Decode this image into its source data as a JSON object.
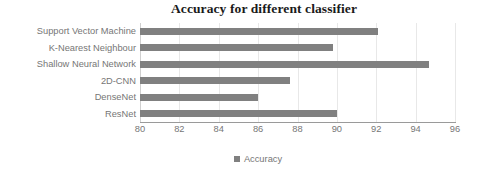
{
  "chart_data": {
    "type": "bar",
    "orientation": "horizontal",
    "title": "Accuracy for different classifier",
    "xlabel": "",
    "ylabel": "",
    "xlim": [
      80,
      96
    ],
    "xticks": [
      80,
      82,
      84,
      86,
      88,
      90,
      92,
      94,
      96
    ],
    "xtick_labels": [
      "80",
      "82",
      "84",
      "86",
      "88",
      "90",
      "92",
      "94",
      "96"
    ],
    "grid": "vertical",
    "legend": {
      "position": "bottom",
      "entries": [
        {
          "label": "Accuracy",
          "color": "#808080"
        }
      ]
    },
    "categories": [
      "Support Vector Machine",
      "K-Nearest Neighbour",
      "Shallow Neural Network",
      "2D-CNN",
      "DenseNet",
      "ResNet"
    ],
    "series": [
      {
        "name": "Accuracy",
        "color": "#808080",
        "values": [
          92.1,
          89.8,
          94.7,
          87.6,
          86.0,
          90.0
        ]
      }
    ]
  },
  "colors": {
    "bar": "#808080",
    "gridline": "#e8e8e8",
    "axis_line": "#9a9a9a",
    "label_text": "#767676",
    "title_text": "#1a1a1a",
    "background": "#ffffff"
  }
}
